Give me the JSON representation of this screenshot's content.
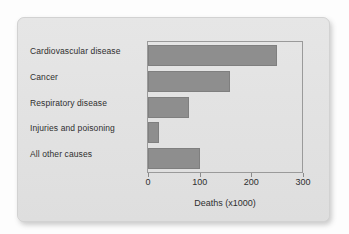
{
  "chart_data": {
    "type": "bar",
    "orientation": "horizontal",
    "title": "",
    "xlabel": "Deaths (x1000)",
    "ylabel": "",
    "categories": [
      "Cardiovascular disease",
      "Cancer",
      "Respiratory disease",
      "Injuries and poisoning",
      "All other causes"
    ],
    "values": [
      250,
      158,
      80,
      22,
      100
    ],
    "xticks": [
      0,
      100,
      200,
      300
    ],
    "xtick_labels": [
      "0",
      "100",
      "200",
      "300"
    ],
    "xlim": [
      0,
      300
    ],
    "grid": false,
    "legend": null,
    "bar_color": "#8e8e8e",
    "panel_color": "#e2e2e2",
    "axis_color": "#9a9a9a",
    "text_color": "#2f2f2f"
  }
}
